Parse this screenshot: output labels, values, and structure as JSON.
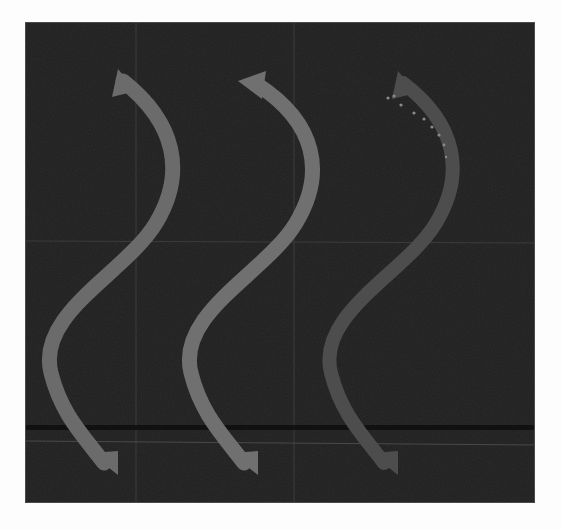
{
  "image": {
    "description": "Three S-shaped grayscale arrows pointing downward on a dark background with faint grid lines",
    "background_color": "#1f1f1f",
    "page_color": "#fdfdfd",
    "grid_color": "#3c3c3c",
    "dark_band_color": "#0c0c0c"
  },
  "arrows": [
    {
      "name": "arrow-1",
      "color": "#6b6b6b",
      "direction": "down"
    },
    {
      "name": "arrow-2",
      "color": "#707070",
      "direction": "down"
    },
    {
      "name": "arrow-3",
      "color": "#4d4d4d",
      "direction": "down",
      "has_dotted_trace": true,
      "dot_color": "#8a8a8a"
    }
  ]
}
